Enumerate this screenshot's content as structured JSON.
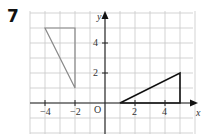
{
  "question": {
    "number": "7"
  },
  "axes": {
    "x_label": "x",
    "y_label": "y",
    "origin_label": "O",
    "x_ticks": [
      {
        "value": -4,
        "label": "−4"
      },
      {
        "value": -2,
        "label": "−2"
      },
      {
        "value": 2,
        "label": "2"
      },
      {
        "value": 4,
        "label": "4"
      }
    ],
    "y_ticks": [
      {
        "value": 2,
        "label": "2"
      },
      {
        "value": 4,
        "label": "4"
      }
    ],
    "x_range": [
      -5,
      6
    ],
    "y_range": [
      -2,
      6
    ]
  },
  "shapes": [
    {
      "name": "gray-triangle",
      "vertices": [
        [
          -4,
          5
        ],
        [
          -2,
          5
        ],
        [
          -2,
          1
        ]
      ],
      "color": "#8a8a8a"
    },
    {
      "name": "black-triangle",
      "vertices": [
        [
          1,
          0
        ],
        [
          5,
          0
        ],
        [
          5,
          2
        ]
      ],
      "color": "#111111"
    }
  ],
  "colors": {
    "grid": "#c8c8c8",
    "axis": "#222222"
  }
}
